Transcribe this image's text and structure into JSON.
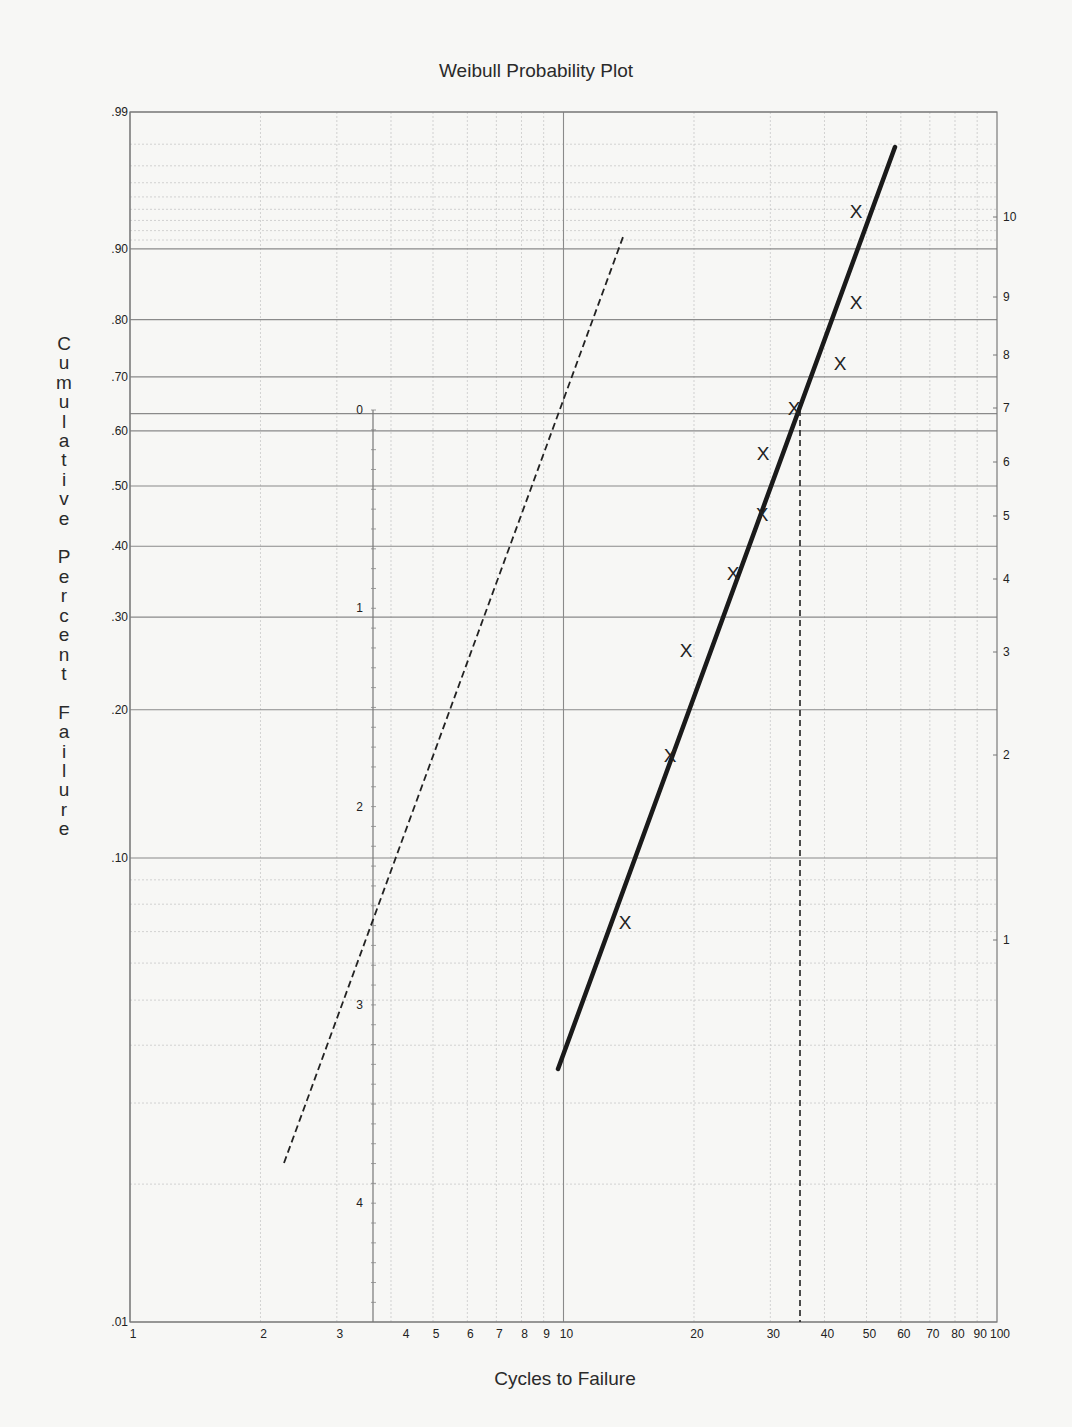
{
  "chart_data": {
    "type": "scatter",
    "title": "Weibull Probability Plot",
    "xlabel": "Cycles to Failure",
    "ylabel": "Cumulative Percent Failure",
    "x_scale": "log",
    "xlim": [
      1,
      100
    ],
    "ylim": [
      0.01,
      0.99
    ],
    "grid": true,
    "x_ticks": [
      "1",
      "2",
      "3",
      "4",
      "5",
      "6",
      "7",
      "8",
      "9",
      "10",
      "20",
      "30",
      "40",
      "50",
      "60",
      "70",
      "80",
      "90",
      "100"
    ],
    "y_ticks_left": [
      ".99",
      ".90",
      ".80",
      ".70",
      ".60",
      ".50",
      ".40",
      ".30",
      ".20",
      ".10",
      ".01"
    ],
    "y_ticks_right": [
      "10",
      "9",
      "8",
      "7",
      "6",
      "5",
      "4",
      "3",
      "2",
      "1"
    ],
    "slope_scale_ticks": [
      "0",
      "1",
      "2",
      "3",
      "4"
    ],
    "series": [
      {
        "name": "Failure data",
        "marker": "X",
        "points": [
          {
            "x": 13.8,
            "y": 0.067,
            "rank": 1
          },
          {
            "x": 17.6,
            "y": 0.16,
            "rank": 2
          },
          {
            "x": 19.2,
            "y": 0.26,
            "rank": 3
          },
          {
            "x": 24.6,
            "y": 0.35,
            "rank": 4
          },
          {
            "x": 28.7,
            "y": 0.45,
            "rank": 5
          },
          {
            "x": 28.9,
            "y": 0.55,
            "rank": 6
          },
          {
            "x": 34.0,
            "y": 0.63,
            "rank": 7
          },
          {
            "x": 43.4,
            "y": 0.71,
            "rank": 8
          },
          {
            "x": 47.4,
            "y": 0.82,
            "rank": 9
          },
          {
            "x": 47.4,
            "y": 0.93,
            "rank": 10
          }
        ]
      },
      {
        "name": "Weibull fit line",
        "style": "solid",
        "from": {
          "x": 10,
          "y": 0.028
        },
        "to": {
          "x": 60,
          "y": 0.98
        }
      },
      {
        "name": "Slope reference line (parallel)",
        "style": "dashed",
        "from": {
          "x": 2.37,
          "y": 0.019
        },
        "to": {
          "x": 14.2,
          "y": 0.9
        }
      },
      {
        "name": "Characteristic life (eta) at 63.2%",
        "style": "dashed-vertical",
        "x": 35,
        "y_from": 0.01,
        "y_to": 0.632
      }
    ],
    "annotations": {
      "eta_estimate": 35,
      "eta_reference_level": 0.632
    }
  },
  "labels": {
    "title": "Weibull Probability Plot",
    "xlabel": "Cycles to Failure",
    "ylabel": "C\nu\nm\nu\nl\na\nt\ni\nv\ne\n \nP\ne\nr\nc\ne\nn\nt\n \nF\na\ni\nl\nu\nr\ne"
  },
  "colors": {
    "background": "#f7f7f5",
    "grid_major": "#8a8a8a",
    "grid_minor": "#c8c8c8",
    "ink": "#222222"
  }
}
